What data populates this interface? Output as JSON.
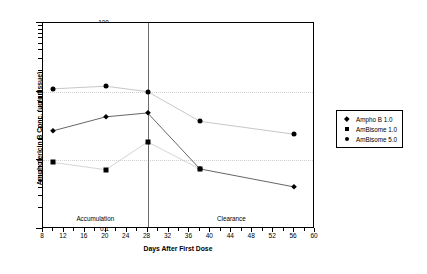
{
  "chart_data": {
    "type": "line",
    "title": "",
    "xlabel": "Days After First Dose",
    "ylabel": "Amphotericin B Conc. (µg/g tissue)",
    "xlim": [
      8,
      60
    ],
    "ylim": [
      0.1,
      100
    ],
    "yscale": "log",
    "xticks": [
      8,
      12,
      16,
      20,
      24,
      28,
      32,
      36,
      40,
      44,
      48,
      52,
      56,
      60
    ],
    "yticks": [
      0.1,
      1,
      10,
      100
    ],
    "grid": "horizontal-dotted",
    "legend_position": "right",
    "annotations": [
      {
        "text": "Accumulation",
        "x": 18,
        "y_px": 214
      },
      {
        "text": "Clearance",
        "x": 44,
        "y_px": 214
      }
    ],
    "divider_x": 28,
    "series": [
      {
        "name": "Ampho B 1.0",
        "marker": "diamond",
        "x": [
          10,
          20,
          28,
          38,
          56
        ],
        "values": [
          2.7,
          4.3,
          4.9,
          0.75,
          0.41
        ]
      },
      {
        "name": "AmBisome 1.0",
        "marker": "square",
        "x": [
          10,
          20,
          28,
          38
        ],
        "values": [
          0.93,
          0.73,
          1.85,
          0.75
        ]
      },
      {
        "name": "AmBisome 5.0",
        "marker": "circle",
        "x": [
          10,
          20,
          28,
          38,
          56
        ],
        "values": [
          11.0,
          12.0,
          10.0,
          3.7,
          2.4
        ]
      }
    ]
  }
}
